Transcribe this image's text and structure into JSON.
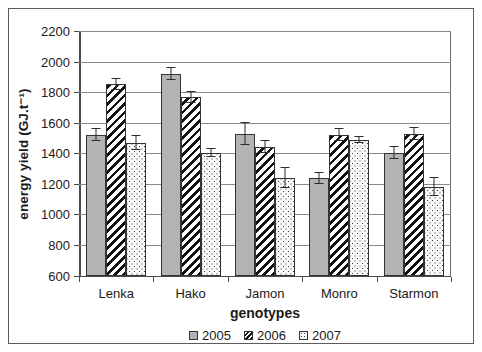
{
  "chart_data": {
    "type": "bar",
    "title": "",
    "xlabel": "genotypes",
    "ylabel": "energy yield  (GJ.t⁻¹)",
    "ylim": [
      600,
      2200
    ],
    "ytick_step": 200,
    "yticks": [
      600,
      800,
      1000,
      1200,
      1400,
      1600,
      1800,
      2000,
      2200
    ],
    "grid": true,
    "legend_position": "bottom-center",
    "categories": [
      "Lenka",
      "Hako",
      "Jamon",
      "Monro",
      "Starmon"
    ],
    "series": [
      {
        "name": "2005",
        "pattern": "solid-gray",
        "values": [
          1520,
          1920,
          1525,
          1235,
          1400
        ],
        "errors": [
          40,
          40,
          70,
          35,
          40
        ]
      },
      {
        "name": "2006",
        "pattern": "diagonal-hatch",
        "values": [
          1850,
          1765,
          1440,
          1520,
          1525
        ]
      },
      {
        "name": "2007",
        "pattern": "dotted",
        "values": [
          1465,
          1400,
          1240,
          1485,
          1180
        ],
        "errors": [
          45,
          25,
          65,
          20,
          60
        ]
      }
    ]
  },
  "legend": {
    "items": [
      {
        "label": "2005"
      },
      {
        "label": "2006"
      },
      {
        "label": "2007"
      }
    ]
  }
}
